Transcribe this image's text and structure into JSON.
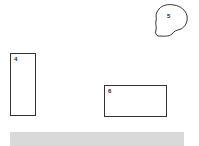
{
  "regions": [
    {
      "id": "4",
      "label": "4",
      "shape": "rectangle"
    },
    {
      "id": "5",
      "label": "5",
      "shape": "irregular-blob"
    },
    {
      "id": "6",
      "label": "6",
      "shape": "rectangle"
    }
  ],
  "colors": {
    "outline": "#333333",
    "bar": "#d9d9d9",
    "background": "#ffffff"
  }
}
